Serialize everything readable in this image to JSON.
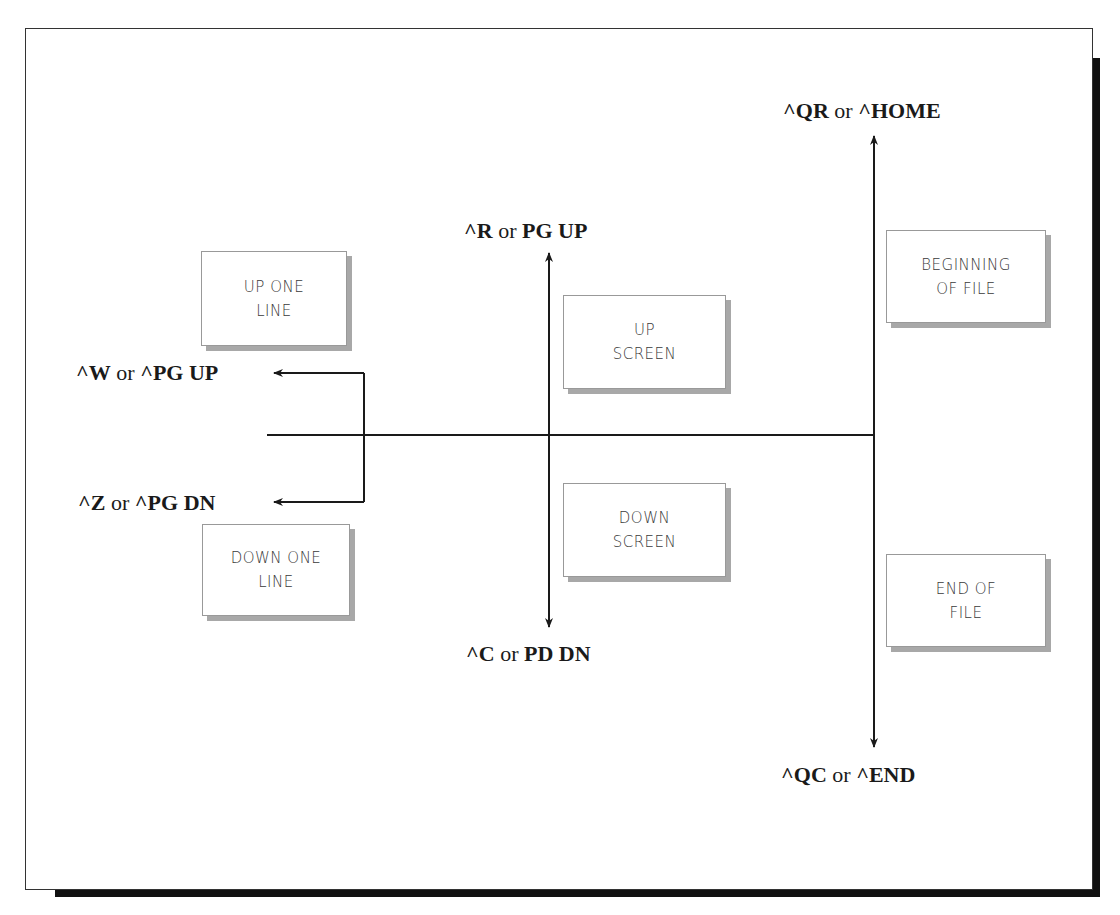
{
  "diagram": {
    "labels": {
      "home": {
        "key1": "^QR",
        "or": " or ",
        "key2": "^HOME"
      },
      "page_up": {
        "key1": "^R",
        "or": " or ",
        "key2": "PG UP"
      },
      "scroll_up": {
        "key1": "^W",
        "or": " or ",
        "key2": "^PG UP"
      },
      "scroll_down": {
        "key1": "^Z",
        "or": " or ",
        "key2": "^PG DN"
      },
      "page_down": {
        "key1": "^C",
        "or": " or ",
        "key2": "PD DN"
      },
      "end": {
        "key1": "^QC",
        "or": " or ",
        "key2": "^END"
      }
    },
    "boxes": {
      "up_one_line": {
        "line1": "UP ONE",
        "line2": "LINE"
      },
      "down_one_line": {
        "line1": "DOWN ONE",
        "line2": "LINE"
      },
      "up_screen": {
        "line1": "UP",
        "line2": "SCREEN"
      },
      "down_screen": {
        "line1": "DOWN",
        "line2": "SCREEN"
      },
      "beginning_of_file": {
        "line1": "BEGINNING",
        "line2": "OF FILE"
      },
      "end_of_file": {
        "line1": "END OF",
        "line2": "FILE"
      }
    },
    "colors": {
      "line": "#1a1a1a",
      "box_border": "#999999",
      "box_shadow": "#a8a8a8",
      "frame_shadow": "#111111"
    }
  }
}
